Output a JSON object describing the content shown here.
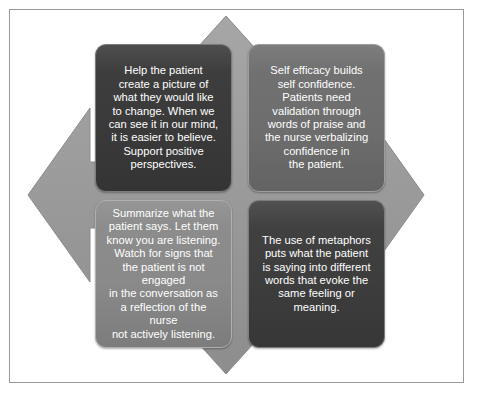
{
  "diagram": {
    "background_color": "#ffffff",
    "frame_color": "#9a9a9a",
    "center_shape": {
      "name": "four-pointed-arrow",
      "color": "#9b9b9b",
      "edge_color": "#8a8a8a"
    },
    "quadrants": [
      {
        "id": "top-left",
        "position": "top-left",
        "fill_color": "#3a3a3a",
        "text_color": "#ffffff",
        "text": "Help the patient\ncreate a picture of\nwhat they would like\nto change. When we\ncan see it in our mind,\nit is easier to believe.\nSupport positive\nperspectives."
      },
      {
        "id": "top-right",
        "position": "top-right",
        "fill_color": "#6e6e6e",
        "text_color": "#ffffff",
        "text": "Self efficacy builds\nself confidence.\nPatients need\nvalidation through\nwords of praise and\nthe nurse verbalizing\nconfidence in\nthe patient."
      },
      {
        "id": "bottom-left",
        "position": "bottom-left",
        "fill_color": "#8a8a8a",
        "text_color": "#ffffff",
        "text": "Summarize what the\npatient says. Let them\nknow you are listening.\nWatch for signs that\nthe patient is not engaged\nin the conversation as\na reflection of the nurse\nnot actively listening."
      },
      {
        "id": "bottom-right",
        "position": "bottom-right",
        "fill_color": "#3d3d3d",
        "text_color": "#ffffff",
        "text": "The use of metaphors\nputs what the patient\nis saying into different\nwords that evoke the\nsame feeling or\nmeaning."
      }
    ]
  }
}
